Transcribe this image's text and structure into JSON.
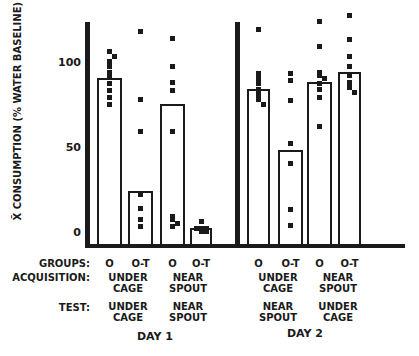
{
  "chart_data": {
    "type": "bar",
    "title": "",
    "ylabel": "X̄ CONSUMPTION (% WATER BASELINE)",
    "xlabel": "",
    "ylim": [
      0,
      125
    ],
    "yticks": [
      0,
      50,
      100
    ],
    "grid": false,
    "legend": null,
    "row_labels": {
      "groups": "GROUPS:",
      "acquisition": "ACQUISITION:",
      "test": "TEST:"
    },
    "days": [
      {
        "label": "DAY 1",
        "conditions": [
          {
            "acquisition": [
              "UNDER",
              "CAGE"
            ],
            "test": [
              "UNDER",
              "CAGE"
            ],
            "groups": [
              {
                "name": "O",
                "mean": 91,
                "points": [
                  107,
                  104,
                  101,
                  98,
                  95,
                  92,
                  88,
                  84,
                  80,
                  76
                ]
              },
              {
                "name": "O-T",
                "mean": 25,
                "points": [
                  119,
                  79,
                  60,
                  23,
                  15,
                  8,
                  4
                ]
              }
            ]
          },
          {
            "acquisition": [
              "NEAR",
              "SPOUT"
            ],
            "test": [
              "NEAR",
              "SPOUT"
            ],
            "groups": [
              {
                "name": "O",
                "mean": 76,
                "points": [
                  115,
                  98,
                  89,
                  84,
                  60,
                  10,
                  8,
                  6,
                  4
                ]
              },
              {
                "name": "O-T",
                "mean": 3,
                "points": [
                  7,
                  3,
                  3,
                  3,
                  1,
                  1
                ]
              }
            ]
          }
        ]
      },
      {
        "label": "DAY 2",
        "conditions": [
          {
            "acquisition": [
              "UNDER",
              "CAGE"
            ],
            "test": [
              "NEAR",
              "SPOUT"
            ],
            "groups": [
              {
                "name": "O",
                "mean": 85,
                "points": [
                  120,
                  94,
                  91,
                  88,
                  85,
                  82,
                  79,
                  76
                ]
              },
              {
                "name": "O-T",
                "mean": 49,
                "points": [
                  94,
                  90,
                  78,
                  53,
                  41,
                  14,
                  5
                ]
              }
            ]
          },
          {
            "acquisition": [
              "NEAR",
              "SPOUT"
            ],
            "test": [
              "UNDER",
              "CAGE"
            ],
            "groups": [
              {
                "name": "O",
                "mean": 89,
                "points": [
                  125,
                  110,
                  95,
                  93,
                  91,
                  88,
                  85,
                  80,
                  63
                ]
              },
              {
                "name": "O-T",
                "mean": 95,
                "points": [
                  128,
                  114,
                  104,
                  98,
                  93,
                  89,
                  86,
                  83
                ]
              }
            ]
          }
        ]
      }
    ]
  }
}
